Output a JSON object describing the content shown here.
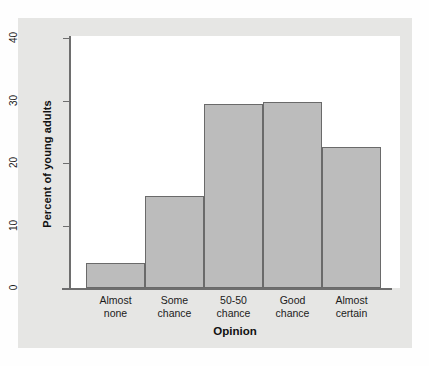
{
  "chart_data": {
    "type": "bar",
    "title": "",
    "subtitle": "",
    "xlabel": "Opinion",
    "ylabel": "Percent of young adults",
    "categories": [
      "Almost none",
      "Some chance",
      "50-50 chance",
      "Good chance",
      "Almost certain"
    ],
    "category_lines": [
      [
        "Almost",
        "none"
      ],
      [
        "Some",
        "chance"
      ],
      [
        "50-50",
        "chance"
      ],
      [
        "Good",
        "chance"
      ],
      [
        "Almost",
        "certain"
      ]
    ],
    "values": [
      4,
      14.8,
      29.5,
      29.8,
      22.5
    ],
    "ylim": [
      0,
      40
    ],
    "yticks": [
      0,
      10,
      20,
      30,
      40
    ],
    "ytick_labels": [
      "0",
      "10",
      "20",
      "30",
      "40"
    ],
    "grid": false,
    "legend": "none",
    "bar_fill_color": "#bcbcbc",
    "bar_edge_color": "#6a6a6a",
    "axis_color": "#6e6e6e",
    "plot_background_color": "#ffffff",
    "panel_background_color": "#e6e6e4",
    "page_background_color": "#fefefe"
  }
}
